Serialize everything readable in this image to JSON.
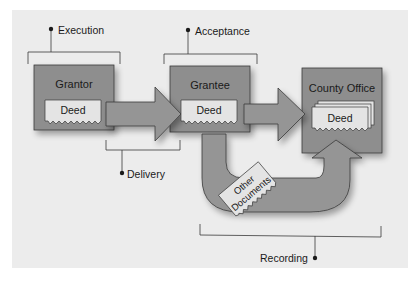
{
  "diagram": {
    "colors": {
      "panel": "#ececec",
      "box_fill": "#8e8e8e",
      "arrow_fill": "#959595",
      "deed_fill": "#e4e4e4",
      "stroke": "#3a3a3a"
    },
    "nodes": [
      {
        "id": "grantor",
        "label": "Grantor",
        "document": "Deed"
      },
      {
        "id": "grantee",
        "label": "Grantee",
        "document": "Deed"
      },
      {
        "id": "county_office",
        "label": "County Office",
        "document": "Deed"
      }
    ],
    "floating_document": "Other Documents",
    "floating_document_lines": [
      "Other",
      "Documents"
    ],
    "edges": [
      {
        "from": "grantor",
        "to": "grantee",
        "type": "arrow"
      },
      {
        "from": "grantee",
        "to": "county_office",
        "type": "arrow"
      },
      {
        "from": "grantee",
        "to": "county_office",
        "type": "u-arrow",
        "carries": "Other Documents"
      }
    ],
    "stages": [
      {
        "label": "Execution",
        "spans": [
          "grantor"
        ]
      },
      {
        "label": "Acceptance",
        "spans": [
          "grantee"
        ]
      },
      {
        "label": "Delivery",
        "spans": [
          "grantor->grantee"
        ]
      },
      {
        "label": "Recording",
        "spans": [
          "grantee->county_office"
        ]
      }
    ]
  }
}
